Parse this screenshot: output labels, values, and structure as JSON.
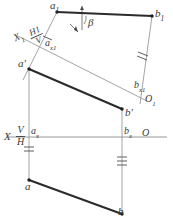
{
  "figure": {
    "canvas": {
      "width": 173,
      "height": 217,
      "background": "#ffffff"
    },
    "style": {
      "thick_line_color": "#2b2b2b",
      "thin_line_color": "#9a9a9a",
      "axis_line_color": "#8c8c8c",
      "tick_color": "#6e6e6e",
      "label_color": "#3a3a3a",
      "point_color": "#1f1f1f"
    }
  },
  "labels": {
    "a1": {
      "text": "a",
      "sub": "1"
    },
    "b1": {
      "text": "b",
      "sub": "1"
    },
    "ax1": {
      "text": "a",
      "sub": "x1"
    },
    "bx1": {
      "text": "b",
      "sub": "x1"
    },
    "o1": {
      "text": "O",
      "sub": "1"
    },
    "x1": {
      "text": "X",
      "sub": "1"
    },
    "a_prime": {
      "text": "a",
      "prime": "′"
    },
    "b_prime": {
      "text": "b",
      "prime": "′"
    },
    "ax": {
      "text": "a",
      "sub": "x"
    },
    "bx": {
      "text": "b",
      "sub": "x"
    },
    "a": {
      "text": "a"
    },
    "b": {
      "text": "b"
    },
    "x": {
      "text": "X"
    },
    "o": {
      "text": "O"
    },
    "beta": {
      "text": "β"
    }
  },
  "fractions": {
    "h1_over_v": {
      "numerator": "H",
      "numerator_sub": "1",
      "denominator": "V"
    },
    "v_over_h": {
      "numerator": "V",
      "denominator": "H"
    }
  },
  "geometry": {
    "points": {
      "a1": {
        "x": 57,
        "y": 12
      },
      "b1": {
        "x": 152,
        "y": 16
      },
      "ax1": {
        "x": 41,
        "y": 44
      },
      "bx1": {
        "x": 133,
        "y": 90
      },
      "a_prime": {
        "x": 29,
        "y": 69
      },
      "b_prime": {
        "x": 122,
        "y": 109
      },
      "ax": {
        "x": 29,
        "y": 137
      },
      "bx": {
        "x": 122,
        "y": 137
      },
      "a": {
        "x": 29,
        "y": 180
      },
      "b": {
        "x": 122,
        "y": 214
      }
    },
    "segments": [
      {
        "name": "a1-b1",
        "weight": "thick"
      },
      {
        "name": "aprime-bprime",
        "weight": "thick"
      },
      {
        "name": "a-b",
        "weight": "thick"
      },
      {
        "name": "a1-ax1-aprime",
        "weight": "thin"
      },
      {
        "name": "b1-bx1-bprime",
        "weight": "thin"
      },
      {
        "name": "x1-axis",
        "weight": "thin"
      },
      {
        "name": "x-axis",
        "weight": "thin"
      },
      {
        "name": "aprime-ax-a",
        "weight": "thin"
      },
      {
        "name": "bprime-bx-b",
        "weight": "thin"
      }
    ],
    "tick_marks": [
      {
        "name": "tick-a1-ax1",
        "count": 1
      },
      {
        "name": "tick-b1-bx1",
        "count": 2
      },
      {
        "name": "tick-ax-a",
        "count": 2
      },
      {
        "name": "tick-bx-b",
        "count": 3
      }
    ],
    "angle_marker": {
      "name": "beta-angle",
      "at": "a1",
      "label": "β"
    }
  }
}
